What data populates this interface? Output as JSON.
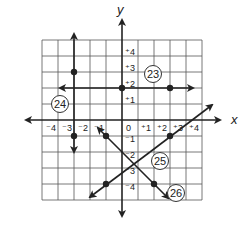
{
  "diagram": {
    "axes": {
      "x_label": "x",
      "y_label": "y",
      "x_ticks": [
        "⁻4",
        "⁻3",
        "⁻2",
        "⁻1",
        "0",
        "⁺1",
        "⁺2",
        "⁺3",
        "⁺4"
      ],
      "y_ticks_pos": [
        "⁺4",
        "⁺3",
        "⁺2",
        "⁺1"
      ],
      "y_ticks_neg": [
        "⁻1",
        "⁻2",
        "⁻3",
        "⁻4"
      ]
    },
    "grid": {
      "xmin": -5,
      "xmax": 5,
      "ymin": -5,
      "ymax": 5
    },
    "problems": [
      {
        "number": "23",
        "description": "Horizontal line y = 2",
        "points": [
          [
            0,
            2
          ],
          [
            3,
            2
          ]
        ]
      },
      {
        "number": "24",
        "description": "Vertical line x = -3",
        "points": [
          [
            -3,
            3
          ],
          [
            -3,
            -1
          ]
        ]
      },
      {
        "number": "25",
        "description": "Line rising left to right",
        "points": [
          [
            3,
            -1
          ],
          [
            -1,
            -4
          ]
        ]
      },
      {
        "number": "26",
        "description": "Line falling left to right",
        "points": [
          [
            -1,
            -1
          ],
          [
            2,
            -4
          ]
        ]
      }
    ]
  }
}
